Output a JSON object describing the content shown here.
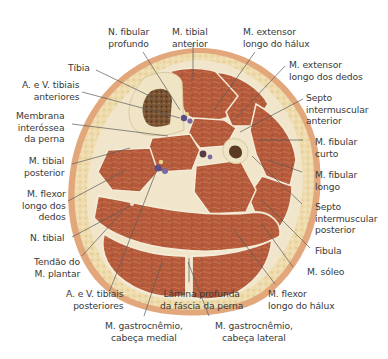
{
  "figure": {
    "type": "anatomical cross-section",
    "colors": {
      "skin": "#e2a57a",
      "fat": "#f0ddb0",
      "muscle": "#b3583a",
      "muscle_light": "#c8714f",
      "fascia": "#f3ead2",
      "bone": "#efe4c5",
      "marrow": "#6e4a2c",
      "vessel": "#5a4a7a",
      "leader_line": "#555555",
      "text": "#3a3a3a"
    }
  },
  "labels": {
    "n_fibular_profundo": "N. fibular\nprofundo",
    "m_tibial_anterior": "M. tibial\nanterior",
    "m_extensor_longo_halux": "M. extensor\nlongo do hálux",
    "m_extensor_longo_dedos": "M. extensor\nlongo dos dedos",
    "septo_anterior": "Septo\nintermuscular\nanterior",
    "m_fibular_curto": "M. fibular\ncurto",
    "m_fibular_longo": "M. fibular\nlongo",
    "septo_posterior": "Septo\nintermuscular\nposterior",
    "fibula": "Fibula",
    "m_soleo": "M. sóleo",
    "m_flexor_longo_halux": "M. flexor\nlongo do hálux",
    "m_gastrocnemio_lateral": "M. gastrocnêmio,\ncabeça lateral",
    "lamina_profunda": "Lâmina profunda\nda fáscia da perna",
    "m_gastrocnemio_medial": "M. gastrocnêmio,\ncabeça medial",
    "a_v_tibiais_posteriores": "A. e V. tibiais\nposteriores",
    "tendao_plantar": "Tendão do\nM. plantar",
    "n_tibial": "N. tibial",
    "m_flexor_longo_dedos": "M. flexor\nlongo dos\ndedos",
    "m_tibial_posterior": "M. tibial\nposterior",
    "membrana_interossea": "Membrana\ninteróssea\nda perna",
    "a_v_tibiais_anteriores": "A. e V. tibiais\nanteriores",
    "tibia": "Tíbia"
  }
}
